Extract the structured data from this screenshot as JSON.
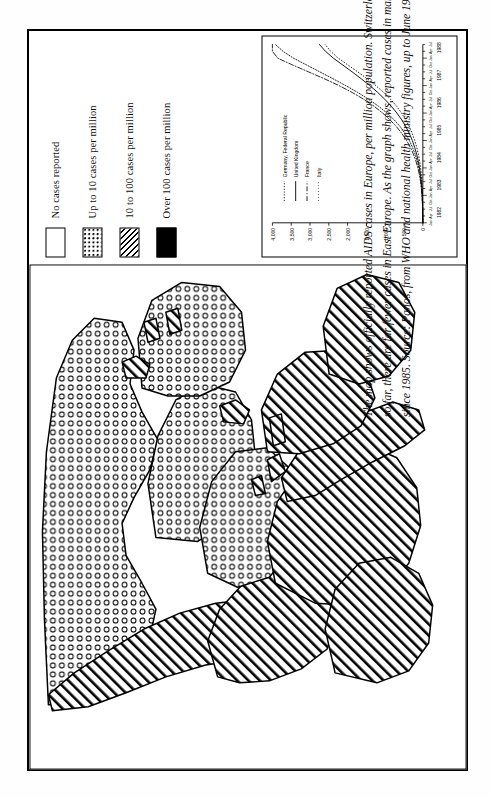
{
  "page": {
    "title": "AIDS cases in Europe",
    "orientation": "rotated-90"
  },
  "caption": {
    "line1": "The map shows officially reported AIDS cases in Europe, per million population. Switzerland has the most severe epidemic in Western Europe;",
    "line2": "so far, there are far fewer cases in East Europe. As the graph shows, reported cases in many West European countries have been rising steeply",
    "line3": "since 1985. Source: Panos, from WHO and national health ministry figures, up to June 1988."
  },
  "legend": {
    "items": [
      {
        "label": "No cases reported",
        "pattern": "none",
        "swatch_class": "sw-none"
      },
      {
        "label": "Up to 10 cases per million",
        "pattern": "dots",
        "swatch_class": "sw-dots"
      },
      {
        "label": "10 to 100 cases per million",
        "pattern": "hatch",
        "swatch_class": "sw-hatch"
      },
      {
        "label": "Over 100 cases per million",
        "pattern": "solid",
        "swatch_class": "sw-solid"
      }
    ]
  },
  "chart_data": {
    "type": "line",
    "title": "",
    "xlabel": "",
    "ylabel": "",
    "ylim": [
      0,
      4000
    ],
    "yticks": [
      0,
      500,
      1000,
      1500,
      2000,
      2500,
      3000,
      3500,
      4000
    ],
    "ytick_labels": [
      "0",
      "500",
      "1,000",
      "1,500",
      "2,000",
      "2,500",
      "3,000",
      "3,500",
      "4,000"
    ],
    "grid": false,
    "legend_position": "upper-left",
    "x_years": [
      "1982",
      "1983",
      "1984",
      "1985",
      "1986",
      "1987",
      "1988"
    ],
    "x_quarter_labels": [
      "Jan",
      "Apr",
      "Jul",
      "Oct"
    ],
    "x": [
      "1982",
      "1982.25",
      "1982.5",
      "1982.75",
      "1983",
      "1983.25",
      "1983.5",
      "1983.75",
      "1984",
      "1984.25",
      "1984.5",
      "1984.75",
      "1985",
      "1985.25",
      "1985.5",
      "1985.75",
      "1986",
      "1986.25",
      "1986.5",
      "1986.75",
      "1987",
      "1987.25",
      "1987.5",
      "1987.75",
      "1988",
      "1988.25",
      "1988.5"
    ],
    "series": [
      {
        "name": "Germany, Federal Republic",
        "style": "dotted",
        "values": [
          0,
          2,
          5,
          10,
          18,
          30,
          48,
          72,
          105,
          150,
          205,
          275,
          360,
          470,
          600,
          760,
          950,
          1180,
          1440,
          1730,
          2050,
          2390,
          2740,
          3090,
          3440,
          3720,
          3920
        ]
      },
      {
        "name": "United Kingdom",
        "style": "solid",
        "values": [
          0,
          2,
          4,
          8,
          15,
          25,
          40,
          60,
          88,
          122,
          165,
          218,
          280,
          358,
          450,
          560,
          690,
          840,
          1010,
          1200,
          1410,
          1640,
          1880,
          2130,
          2380,
          2590,
          2750
        ]
      },
      {
        "name": "France",
        "style": "dashdot",
        "values": [
          0,
          3,
          7,
          14,
          24,
          40,
          62,
          92,
          132,
          184,
          250,
          332,
          432,
          556,
          700,
          870,
          1070,
          1300,
          1570,
          1880,
          2230,
          2620,
          3040,
          3460,
          3860,
          4000,
          4000
        ]
      },
      {
        "name": "Italy",
        "style": "finedot",
        "values": [
          0,
          1,
          2,
          5,
          9,
          16,
          26,
          40,
          60,
          86,
          120,
          162,
          215,
          280,
          358,
          452,
          566,
          700,
          858,
          1040,
          1250,
          1480,
          1730,
          1990,
          2250,
          2450,
          2600
        ]
      }
    ]
  },
  "map": {
    "region": "Europe",
    "description": "Outline map of Europe shaded by reported AIDS cases per million population"
  }
}
